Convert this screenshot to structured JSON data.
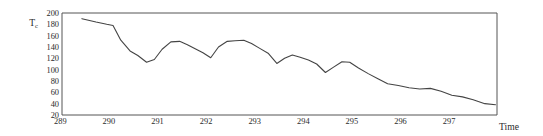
{
  "chart_data": {
    "type": "line",
    "title": "",
    "xlabel": "Time",
    "ylabel": "Tc",
    "ylabel_base": "T",
    "ylabel_sub": "c",
    "xlim": [
      289,
      297.95
    ],
    "ylim": [
      20,
      200
    ],
    "grid": false,
    "legend": null,
    "ytick_labels": [
      "200",
      "180",
      "160",
      "140",
      "120",
      "100",
      "80",
      "60",
      "40",
      "20"
    ],
    "ytick_values": [
      200,
      180,
      160,
      140,
      120,
      100,
      80,
      60,
      40,
      20
    ],
    "xtick_labels": [
      "289",
      "290",
      "291",
      "292",
      "293",
      "294",
      "295",
      "296",
      "297"
    ],
    "xtick_values": [
      289,
      290,
      291,
      292,
      293,
      294,
      295,
      296,
      297
    ],
    "series": [
      {
        "name": "Tc",
        "color": "#444444",
        "x": [
          289.41,
          289.7,
          289.92,
          290.05,
          290.21,
          290.4,
          290.56,
          290.74,
          290.9,
          291.06,
          291.24,
          291.42,
          291.58,
          291.74,
          291.9,
          292.06,
          292.22,
          292.4,
          292.56,
          292.74,
          292.9,
          293.06,
          293.24,
          293.42,
          293.58,
          293.74,
          293.9,
          294.07,
          294.24,
          294.42,
          294.58,
          294.76,
          294.92,
          295.1,
          295.3,
          295.5,
          295.7,
          295.92,
          296.14,
          296.36,
          296.58,
          296.8,
          297.02,
          297.24,
          297.46,
          297.7,
          297.92
        ],
        "y": [
          190,
          184,
          180,
          178,
          152,
          133,
          125,
          113,
          118,
          136,
          149,
          150,
          144,
          137,
          130,
          121,
          140,
          150,
          151,
          152,
          146,
          138,
          129,
          111,
          120,
          126,
          122,
          117,
          110,
          95,
          104,
          114,
          113,
          103,
          93,
          84,
          75,
          72,
          68,
          66,
          67,
          62,
          55,
          52,
          47,
          40,
          38
        ]
      }
    ],
    "axes_style": {
      "frame_color": "#555555",
      "plot_left": 62,
      "plot_right": 497,
      "plot_top": 13,
      "plot_bottom": 115
    }
  }
}
